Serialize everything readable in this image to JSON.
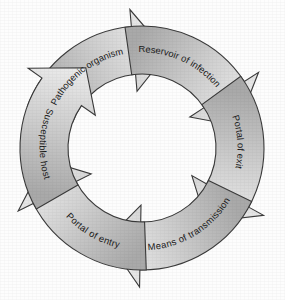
{
  "diagram": {
    "type": "cycle-diagram",
    "background_color": "#fdfdfd",
    "outline_color": "#3a3a3a",
    "text_color": "#1a1a1a",
    "center": {
      "x": 142,
      "y": 148
    },
    "inner_radius": 74,
    "outer_radius": 122,
    "direction": "clockwise",
    "segment_count": 6,
    "segments": [
      {
        "id": "pathogenic-organism",
        "label": "Pathogenic organism",
        "order": 1,
        "position": "top-left",
        "start_angle": -160,
        "end_angle": -75,
        "tail_color": "#a9a9a9",
        "head_color": "#ececec",
        "text_flip": false
      },
      {
        "id": "reservoir-of-infection",
        "label": "Reservoir of infection",
        "order": 2,
        "position": "top-right",
        "start_angle": -98,
        "end_angle": -13,
        "tail_color": "#a9a9a9",
        "head_color": "#ececec",
        "text_flip": false
      },
      {
        "id": "portal-of-exit",
        "label": "Portal of exit",
        "order": 3,
        "position": "right",
        "start_angle": -36,
        "end_angle": 49,
        "tail_color": "#a9a9a9",
        "head_color": "#ececec",
        "text_flip": false
      },
      {
        "id": "means-of-transmission",
        "label": "Means of transmission",
        "order": 4,
        "position": "bottom",
        "start_angle": 26,
        "end_angle": 111,
        "tail_color": "#a9a9a9",
        "head_color": "#ececec",
        "text_flip": true
      },
      {
        "id": "portal-of-entry",
        "label": "Portal of entry",
        "order": 5,
        "position": "bottom-left",
        "start_angle": 88,
        "end_angle": 173,
        "tail_color": "#a9a9a9",
        "head_color": "#ececec",
        "text_flip": true
      },
      {
        "id": "susceptible-host",
        "label": "Susceptible host",
        "order": 6,
        "position": "left",
        "start_angle": 150,
        "end_angle": 235,
        "tail_color": "#a9a9a9",
        "head_color": "#ececec",
        "text_flip": true
      }
    ]
  }
}
